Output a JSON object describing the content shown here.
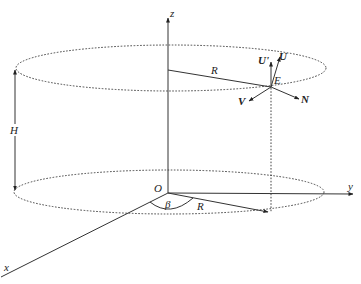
{
  "diagram": {
    "labels": {
      "z_axis": "z",
      "y_axis": "y",
      "x_axis": "x",
      "origin": "O",
      "height": "H",
      "radius_top": "R",
      "radius_bottom": "R",
      "angle": "β",
      "point": "E",
      "vec_U": "U",
      "vec_U_prime": "U'",
      "vec_V": "V",
      "vec_N": "N"
    },
    "colors": {
      "line": "#333333",
      "text": "#222222",
      "background": "#ffffff"
    }
  }
}
